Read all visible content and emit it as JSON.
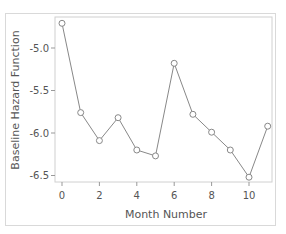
{
  "chart_data": {
    "type": "line",
    "title": "",
    "xlabel": "Month Number",
    "ylabel": "Baseline Hazard Function",
    "x": [
      0,
      1,
      2,
      3,
      4,
      5,
      6,
      7,
      8,
      9,
      10,
      11
    ],
    "series": [
      {
        "name": "Baseline Hazard",
        "values": [
          -4.71,
          -5.76,
          -6.09,
          -5.82,
          -6.2,
          -6.27,
          -5.18,
          -5.78,
          -5.99,
          -6.2,
          -6.52,
          -5.92
        ]
      }
    ],
    "x_ticks": [
      "0",
      "2",
      "4",
      "6",
      "8",
      "10"
    ],
    "y_ticks": [
      "-5.0",
      "-5.5",
      "-6.0",
      "-6.5"
    ],
    "xlim": [
      -0.4,
      11.4
    ],
    "ylim": [
      -6.58,
      -4.64
    ],
    "grid": false,
    "legend": null,
    "marker": "open-circle",
    "line_color": "#777777"
  }
}
